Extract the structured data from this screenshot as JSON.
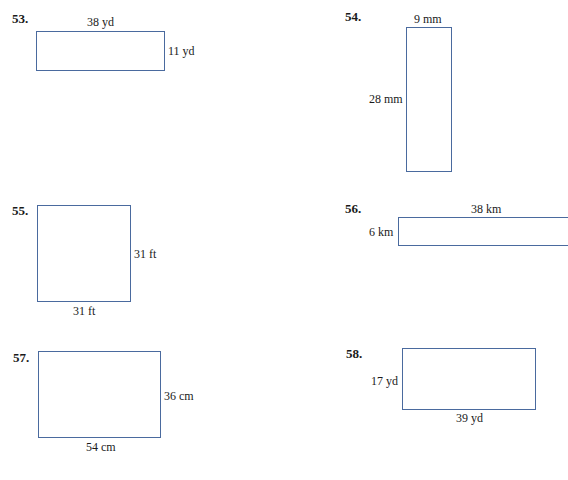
{
  "problems": [
    {
      "number": "53.",
      "top_label": "38 yd",
      "right_label": "11 yd"
    },
    {
      "number": "54.",
      "top_label": "9 mm",
      "left_label": "28 mm"
    },
    {
      "number": "55.",
      "right_label": "31 ft",
      "bottom_label": "31 ft"
    },
    {
      "number": "56.",
      "top_label": "38 km",
      "left_label": "6 km"
    },
    {
      "number": "57.",
      "right_label": "36 cm",
      "bottom_label": "54 cm"
    },
    {
      "number": "58.",
      "left_label": "17 yd",
      "bottom_label": "39 yd"
    }
  ],
  "colors": {
    "rectangle_border": "#4a6a9e",
    "text": "#1a1a1a"
  }
}
